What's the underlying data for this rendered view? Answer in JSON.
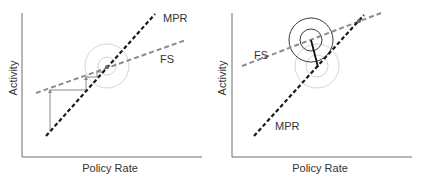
{
  "diagrams": [
    {
      "id": "left",
      "xlabel": "Policy Rate",
      "ylabel": "Activity",
      "labels": {
        "mpr": "MPR",
        "fs": "FS"
      },
      "colors": {
        "mpr": "#1a1a1a",
        "fs": "#8c8c8c",
        "axis": "#6e6e6e",
        "circles": "#d0d0d0",
        "steps": "#8a8a8a"
      }
    },
    {
      "id": "right",
      "xlabel": "Policy Rate",
      "ylabel": "Activity",
      "labels": {
        "mpr": "MPR",
        "fs": "FS"
      },
      "colors": {
        "mpr": "#1a1a1a",
        "fs": "#8c8c8c",
        "axis": "#6e6e6e",
        "circles_dark": "#3a3a3a",
        "circles_light": "#d0d0d0",
        "connector": "#111111"
      }
    }
  ]
}
